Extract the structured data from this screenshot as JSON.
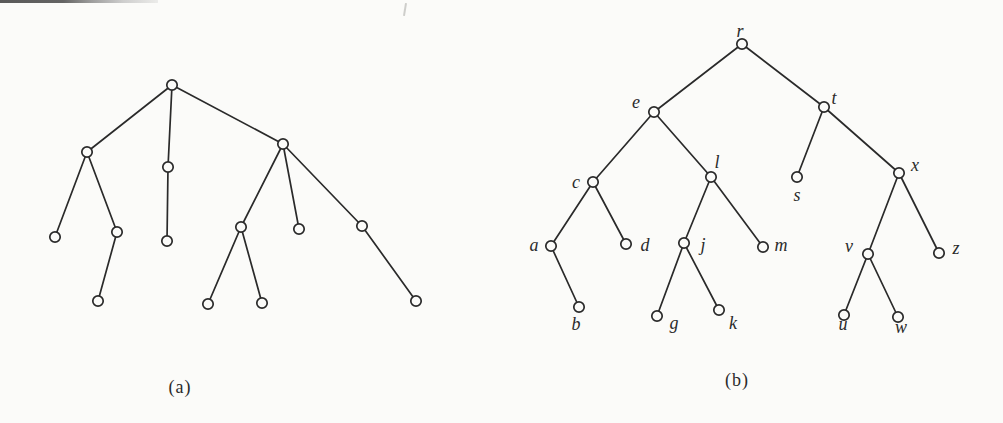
{
  "figure": {
    "background": "#fbfbf9",
    "ink": "#2a2a2a",
    "node_radius": 5.2,
    "stroke_width": 1.7
  },
  "trees": [
    {
      "id": "a",
      "caption": "(a)",
      "nodes": [
        {
          "id": "n1",
          "x": 172,
          "y": 85,
          "label": ""
        },
        {
          "id": "n2",
          "x": 87,
          "y": 152,
          "label": ""
        },
        {
          "id": "n3",
          "x": 168,
          "y": 167,
          "label": ""
        },
        {
          "id": "n4",
          "x": 283,
          "y": 144,
          "label": ""
        },
        {
          "id": "n5",
          "x": 55,
          "y": 237,
          "label": ""
        },
        {
          "id": "n6",
          "x": 117,
          "y": 232,
          "label": ""
        },
        {
          "id": "n7",
          "x": 98,
          "y": 301,
          "label": ""
        },
        {
          "id": "n8",
          "x": 167,
          "y": 241,
          "label": ""
        },
        {
          "id": "n9",
          "x": 241,
          "y": 227,
          "label": ""
        },
        {
          "id": "n10",
          "x": 208,
          "y": 304,
          "label": ""
        },
        {
          "id": "n11",
          "x": 262,
          "y": 303,
          "label": ""
        },
        {
          "id": "n12",
          "x": 299,
          "y": 229,
          "label": ""
        },
        {
          "id": "n13",
          "x": 362,
          "y": 226,
          "label": ""
        },
        {
          "id": "n14",
          "x": 416,
          "y": 301,
          "label": ""
        }
      ],
      "edges": [
        [
          "n1",
          "n2"
        ],
        [
          "n1",
          "n3"
        ],
        [
          "n1",
          "n4"
        ],
        [
          "n2",
          "n5"
        ],
        [
          "n2",
          "n6"
        ],
        [
          "n6",
          "n7"
        ],
        [
          "n3",
          "n8"
        ],
        [
          "n4",
          "n9"
        ],
        [
          "n9",
          "n10"
        ],
        [
          "n9",
          "n11"
        ],
        [
          "n4",
          "n12"
        ],
        [
          "n4",
          "n13"
        ],
        [
          "n13",
          "n14"
        ]
      ]
    },
    {
      "id": "b",
      "caption": "(b)",
      "nodes": [
        {
          "id": "r",
          "x": 742,
          "y": 44,
          "label": "r",
          "lx": 740,
          "ly": 37
        },
        {
          "id": "e",
          "x": 654,
          "y": 112,
          "label": "e",
          "lx": 636,
          "ly": 108
        },
        {
          "id": "t",
          "x": 824,
          "y": 107,
          "label": "t",
          "lx": 834,
          "ly": 104
        },
        {
          "id": "c",
          "x": 593,
          "y": 182,
          "label": "c",
          "lx": 576,
          "ly": 188
        },
        {
          "id": "l",
          "x": 711,
          "y": 177,
          "label": "l",
          "lx": 717,
          "ly": 168
        },
        {
          "id": "s",
          "x": 797,
          "y": 177,
          "label": "s",
          "lx": 797,
          "ly": 201
        },
        {
          "id": "x",
          "x": 899,
          "y": 173,
          "label": "x",
          "lx": 915,
          "ly": 171
        },
        {
          "id": "a",
          "x": 551,
          "y": 246,
          "label": "a",
          "lx": 534,
          "ly": 251
        },
        {
          "id": "d",
          "x": 626,
          "y": 244,
          "label": "d",
          "lx": 645,
          "ly": 251
        },
        {
          "id": "j",
          "x": 684,
          "y": 243,
          "label": "j",
          "lx": 703,
          "ly": 251
        },
        {
          "id": "m",
          "x": 763,
          "y": 247,
          "label": "m",
          "lx": 781,
          "ly": 251
        },
        {
          "id": "v",
          "x": 868,
          "y": 254,
          "label": "v",
          "lx": 849,
          "ly": 252
        },
        {
          "id": "z",
          "x": 939,
          "y": 253,
          "label": "z",
          "lx": 956,
          "ly": 254
        },
        {
          "id": "b",
          "x": 579,
          "y": 307,
          "label": "b",
          "lx": 576,
          "ly": 330
        },
        {
          "id": "g",
          "x": 657,
          "y": 316,
          "label": "g",
          "lx": 674,
          "ly": 329
        },
        {
          "id": "k",
          "x": 719,
          "y": 310,
          "label": "k",
          "lx": 733,
          "ly": 329
        },
        {
          "id": "u",
          "x": 844,
          "y": 315,
          "label": "u",
          "lx": 843,
          "ly": 330
        },
        {
          "id": "w",
          "x": 898,
          "y": 317,
          "label": "w",
          "lx": 901,
          "ly": 333
        }
      ],
      "edges": [
        [
          "r",
          "e"
        ],
        [
          "r",
          "t"
        ],
        [
          "e",
          "c"
        ],
        [
          "e",
          "l"
        ],
        [
          "t",
          "s"
        ],
        [
          "t",
          "x"
        ],
        [
          "c",
          "a"
        ],
        [
          "c",
          "d"
        ],
        [
          "a",
          "b"
        ],
        [
          "l",
          "j"
        ],
        [
          "l",
          "m"
        ],
        [
          "j",
          "g"
        ],
        [
          "j",
          "k"
        ],
        [
          "x",
          "v"
        ],
        [
          "x",
          "z"
        ],
        [
          "v",
          "u"
        ],
        [
          "v",
          "w"
        ]
      ]
    }
  ]
}
